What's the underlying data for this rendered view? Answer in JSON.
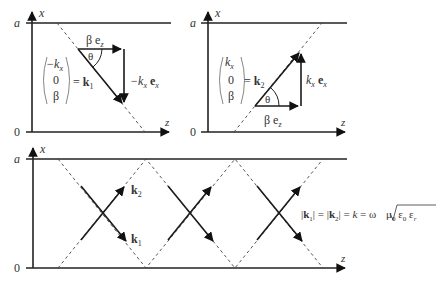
{
  "figure": {
    "panels": [
      {
        "id": "top-left",
        "axis_x_label": "x",
        "axis_z_label": "z",
        "tick_top": "a",
        "tick_bottom": "0",
        "vector_column": [
          "−k",
          "0",
          "β"
        ],
        "vector_column_sub": [
          "x",
          "",
          ""
        ],
        "vector_equals": "= ",
        "vector_name": "k",
        "vector_name_sub": "1",
        "component_z": "β e",
        "component_z_sub": "z",
        "component_x": "−k",
        "component_x_sub": "x",
        "component_x_unit": "e",
        "component_x_unit_sub": "x",
        "angle": "θ"
      },
      {
        "id": "top-right",
        "axis_x_label": "x",
        "axis_z_label": "z",
        "tick_top": "a",
        "tick_bottom": "0",
        "vector_column": [
          "k",
          "0",
          "β"
        ],
        "vector_column_sub": [
          "x",
          "",
          ""
        ],
        "vector_equals": "= ",
        "vector_name": "k",
        "vector_name_sub": "2",
        "component_z": "β e",
        "component_z_sub": "z",
        "component_x": "k",
        "component_x_sub": "x",
        "component_x_unit": "e",
        "component_x_unit_sub": "x",
        "angle": "θ"
      },
      {
        "id": "bottom",
        "axis_x_label": "x",
        "axis_z_label": "z",
        "tick_top": "a",
        "tick_bottom": "0",
        "label_k2": "k",
        "label_k2_sub": "2",
        "label_k1": "k",
        "label_k1_sub": "1",
        "formula": {
          "part1": "|",
          "k1": "k",
          "k1_sub": "1",
          "part2": "| = |",
          "k2": "k",
          "k2_sub": "2",
          "part3": "| = ",
          "k": "k",
          "eq": " = ω ",
          "sqrt_content": "μ",
          "mu_sub": "0",
          "eps": " ε",
          "eps0_sub": "0",
          "eps2": " ε",
          "epsr_sub": "r"
        }
      }
    ]
  }
}
